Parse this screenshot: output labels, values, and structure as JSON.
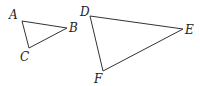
{
  "diagram": {
    "type": "geometry",
    "triangles": [
      {
        "name": "ABC",
        "vertices": [
          {
            "label": "A",
            "x": 22,
            "y": 21,
            "lx": 9,
            "ly": 19
          },
          {
            "label": "B",
            "x": 67,
            "y": 28,
            "lx": 69,
            "ly": 32
          },
          {
            "label": "C",
            "x": 29,
            "y": 48,
            "lx": 20,
            "ly": 61
          }
        ]
      },
      {
        "name": "DEF",
        "vertices": [
          {
            "label": "D",
            "x": 90,
            "y": 16,
            "lx": 80,
            "ly": 16
          },
          {
            "label": "E",
            "x": 183,
            "y": 29,
            "lx": 185,
            "ly": 34
          },
          {
            "label": "F",
            "x": 103,
            "y": 71,
            "lx": 94,
            "ly": 83
          }
        ]
      }
    ],
    "stroke_color": "#333333",
    "label_color": "#222222"
  }
}
